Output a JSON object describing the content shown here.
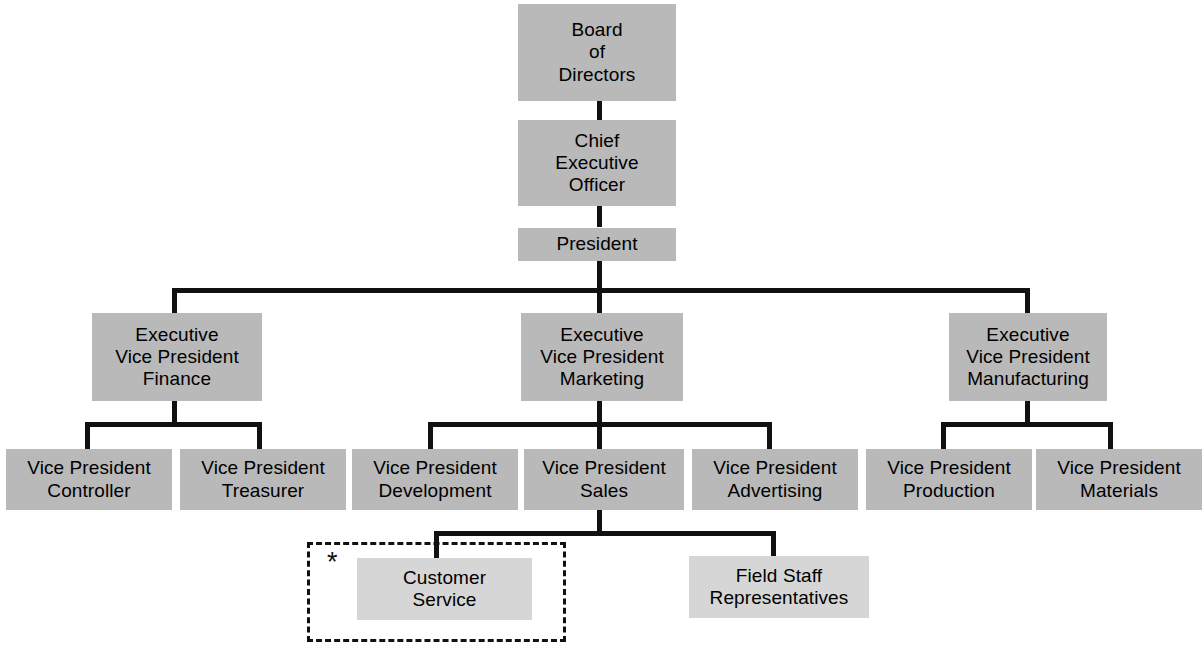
{
  "chart": {
    "box_color": "#b9b9b9",
    "box_color_light": "#d6d6d6",
    "line_color": "#111111",
    "background": "#ffffff",
    "annotation_symbol": "*"
  },
  "nodes": {
    "board": {
      "lines": [
        "Board",
        "of",
        "Directors"
      ]
    },
    "ceo": {
      "lines": [
        "Chief",
        "Executive",
        "Officer"
      ]
    },
    "president": {
      "lines": [
        "President"
      ]
    },
    "evp_finance": {
      "lines": [
        "Executive",
        "Vice President",
        "Finance"
      ]
    },
    "evp_marketing": {
      "lines": [
        "Executive",
        "Vice President",
        "Marketing"
      ]
    },
    "evp_manufacturing": {
      "lines": [
        "Executive",
        "Vice President",
        "Manufacturing"
      ]
    },
    "vp_controller": {
      "lines": [
        "Vice President",
        "Controller"
      ]
    },
    "vp_treasurer": {
      "lines": [
        "Vice President",
        "Treasurer"
      ]
    },
    "vp_development": {
      "lines": [
        "Vice President",
        "Development"
      ]
    },
    "vp_sales": {
      "lines": [
        "Vice President",
        "Sales"
      ]
    },
    "vp_advertising": {
      "lines": [
        "Vice President",
        "Advertising"
      ]
    },
    "vp_production": {
      "lines": [
        "Vice President",
        "Production"
      ]
    },
    "vp_materials": {
      "lines": [
        "Vice President",
        "Materials"
      ]
    },
    "customer_service": {
      "lines": [
        "Customer",
        "Service"
      ]
    },
    "field_staff": {
      "lines": [
        "Field Staff",
        "Representatives"
      ]
    }
  }
}
